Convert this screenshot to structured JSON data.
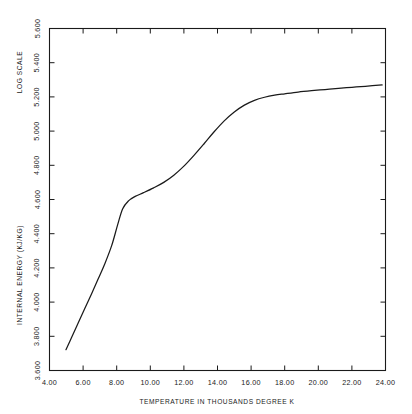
{
  "chart_data": {
    "type": "line",
    "title": "",
    "xlabel": "TEMPERATURE IN THOUSANDS DEGREE K",
    "ylabel": "INTERNAL ENERGY (KJ/KG)",
    "ylabel_secondary": "LOG SCALE",
    "xlim": [
      4.0,
      24.0
    ],
    "ylim": [
      3.6,
      5.6
    ],
    "xticks": [
      4.0,
      6.0,
      8.0,
      10.0,
      12.0,
      14.0,
      16.0,
      18.0,
      20.0,
      22.0,
      24.0
    ],
    "yticks": [
      3.6,
      4.0,
      4.2,
      4.4,
      4.6,
      4.8,
      5.0,
      5.2,
      5.4,
      5.6
    ],
    "xtick_labels": [
      "4.00",
      "6.00",
      "8.00",
      "10.00",
      "12.00",
      "14.00",
      "16.00",
      "18.00",
      "20.00",
      "22.00",
      "24.00"
    ],
    "ytick_labels": [
      "3.600",
      "3.800",
      "4.000",
      "4.200",
      "4.400",
      "4.600",
      "4.800",
      "5.000",
      "5.200",
      "5.400",
      "5.600"
    ],
    "ytick_values": [
      3.6,
      3.8,
      4.0,
      4.2,
      4.4,
      4.6,
      4.8,
      5.0,
      5.2,
      5.4,
      5.6
    ],
    "grid": false,
    "legend": null,
    "series": [
      {
        "name": "internal energy",
        "x": [
          4.98,
          5.3,
          5.7,
          6.1,
          6.5,
          6.9,
          7.3,
          7.7,
          8.05,
          8.35,
          8.7,
          9.1,
          9.6,
          10.2,
          10.8,
          11.4,
          12.0,
          12.6,
          13.2,
          13.8,
          14.4,
          15.0,
          15.6,
          16.2,
          16.8,
          17.4,
          18.0,
          18.8,
          19.6,
          20.4,
          21.2,
          22.0,
          22.8,
          23.8
        ],
        "y": [
          3.722,
          3.79,
          3.876,
          3.962,
          4.048,
          4.136,
          4.226,
          4.33,
          4.45,
          4.545,
          4.592,
          4.618,
          4.64,
          4.668,
          4.7,
          4.742,
          4.795,
          4.858,
          4.926,
          4.996,
          5.06,
          5.112,
          5.152,
          5.18,
          5.198,
          5.21,
          5.218,
          5.228,
          5.236,
          5.243,
          5.25,
          5.256,
          5.262,
          5.27
        ]
      }
    ]
  }
}
